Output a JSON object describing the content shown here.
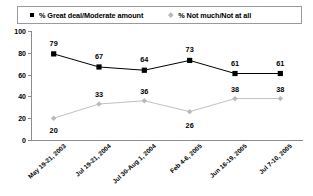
{
  "chart_data": {
    "type": "line",
    "title": "",
    "subtitle": "",
    "xlabel": "",
    "ylabel": "",
    "ylim": [
      0,
      100
    ],
    "yticks": [
      0,
      20,
      40,
      60,
      80,
      100
    ],
    "grid": false,
    "legend_position": "top",
    "categories": [
      "May 19-21, 2003",
      "Jul 19-21, 2004",
      "Jul 30-Aug 1, 2004",
      "Feb 4-6, 2005",
      "Jun 16-19, 2005",
      "Jul 7-10, 2005"
    ],
    "series": [
      {
        "name": "% Great deal/Moderate amount",
        "marker": "square",
        "color": "#000000",
        "values": [
          79,
          67,
          64,
          73,
          61,
          61
        ]
      },
      {
        "name": "% Not much/Not at all",
        "marker": "diamond",
        "color": "#b9b9b9",
        "values": [
          20,
          33,
          36,
          26,
          38,
          38
        ]
      }
    ]
  },
  "legend": {
    "entries": [
      {
        "label": "% Great deal/Moderate amount",
        "marker_icon": "square-marker-icon"
      },
      {
        "label": "% Not much/Not at all",
        "marker_icon": "diamond-marker-icon"
      }
    ]
  },
  "axis": {
    "y_tick_labels": [
      "100",
      "80",
      "60",
      "40",
      "20",
      "0"
    ]
  }
}
